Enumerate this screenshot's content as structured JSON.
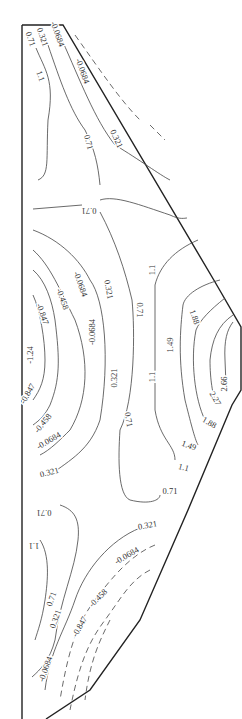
{
  "diagram": {
    "type": "contour-plot",
    "outline_color": "#222222",
    "contour_color": "#444444",
    "labels": [
      {
        "text": "0.71",
        "x": 28,
        "y": 40,
        "rot": 70
      },
      {
        "text": "0.321",
        "x": 40,
        "y": 38,
        "rot": 70
      },
      {
        "text": "-0.0684",
        "x": 55,
        "y": 35,
        "rot": 70
      },
      {
        "text": "-0.0684",
        "x": 80,
        "y": 72,
        "rot": 70
      },
      {
        "text": "1.1",
        "x": 38,
        "y": 77,
        "rot": 70
      },
      {
        "text": "0.71",
        "x": 86,
        "y": 143,
        "rot": 75
      },
      {
        "text": "0.321",
        "x": 114,
        "y": 140,
        "rot": 65
      },
      {
        "text": "0.71",
        "x": 89,
        "y": 208,
        "rot": 180
      },
      {
        "text": "1.1",
        "x": 155,
        "y": 270,
        "rot": -90
      },
      {
        "text": "-0.0684",
        "x": 78,
        "y": 285,
        "rot": 70
      },
      {
        "text": "0.321",
        "x": 106,
        "y": 290,
        "rot": 80
      },
      {
        "text": "-0.458",
        "x": 60,
        "y": 300,
        "rot": 70
      },
      {
        "text": "0.71",
        "x": 137,
        "y": 310,
        "rot": 90
      },
      {
        "text": "-0.847",
        "x": 40,
        "y": 315,
        "rot": 70
      },
      {
        "text": "1.88",
        "x": 192,
        "y": 318,
        "rot": 70
      },
      {
        "text": "-0.0684",
        "x": 95,
        "y": 332,
        "rot": -90
      },
      {
        "text": "1.49",
        "x": 173,
        "y": 345,
        "rot": -90
      },
      {
        "text": "-1.24",
        "x": 33,
        "y": 355,
        "rot": -90
      },
      {
        "text": "0.321",
        "x": 117,
        "y": 378,
        "rot": -90
      },
      {
        "text": "1.1",
        "x": 155,
        "y": 377,
        "rot": -90
      },
      {
        "text": "2.66",
        "x": 227,
        "y": 384,
        "rot": -90
      },
      {
        "text": "-0.847",
        "x": 30,
        "y": 395,
        "rot": -60
      },
      {
        "text": "2.27",
        "x": 213,
        "y": 400,
        "rot": 60
      },
      {
        "text": "0.71",
        "x": 126,
        "y": 420,
        "rot": 80
      },
      {
        "text": "-0.458",
        "x": 45,
        "y": 425,
        "rot": -50
      },
      {
        "text": "1.88",
        "x": 208,
        "y": 425,
        "rot": 30
      },
      {
        "text": "-0.0684",
        "x": 50,
        "y": 443,
        "rot": -30
      },
      {
        "text": "1.49",
        "x": 188,
        "y": 448,
        "rot": 20
      },
      {
        "text": "0.321",
        "x": 50,
        "y": 475,
        "rot": -15
      },
      {
        "text": "1.1",
        "x": 183,
        "y": 470,
        "rot": 15
      },
      {
        "text": "0.71",
        "x": 170,
        "y": 494,
        "rot": 0
      },
      {
        "text": "0.71",
        "x": 44,
        "y": 510,
        "rot": 180
      },
      {
        "text": "1.1",
        "x": 34,
        "y": 543,
        "rot": 180
      },
      {
        "text": "0.321",
        "x": 148,
        "y": 528,
        "rot": -10
      },
      {
        "text": "-0.0684",
        "x": 128,
        "y": 558,
        "rot": -30
      },
      {
        "text": "0.71",
        "x": 54,
        "y": 600,
        "rot": -70
      },
      {
        "text": "-0.458",
        "x": 100,
        "y": 600,
        "rot": -45
      },
      {
        "text": "0.321",
        "x": 58,
        "y": 620,
        "rot": -70
      },
      {
        "text": "-0.847",
        "x": 82,
        "y": 628,
        "rot": -60
      },
      {
        "text": "-0.0684",
        "x": 48,
        "y": 670,
        "rot": -70
      }
    ]
  }
}
